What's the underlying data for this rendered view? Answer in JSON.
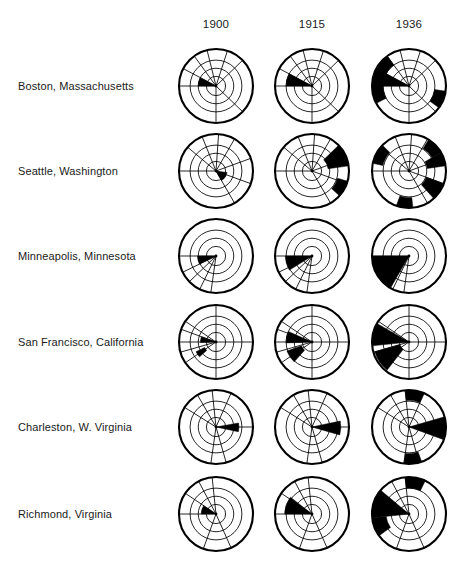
{
  "figure": {
    "title": "",
    "background": "#ffffff",
    "ink": "#000000",
    "fill": "#000000"
  },
  "columns": [
    {
      "label": "1900",
      "cx": 216
    },
    {
      "label": "1915",
      "cx": 312
    },
    {
      "label": "1936",
      "cx": 409
    }
  ],
  "rows": [
    {
      "label": "Boston, Massachusetts",
      "cy": 86
    },
    {
      "label": "Seattle, Washington",
      "cy": 171
    },
    {
      "label": "Minneapolis, Minnesota",
      "cy": 256
    },
    {
      "label": "San Francisco, California",
      "cy": 342
    },
    {
      "label": "Charleston, W. Virginia",
      "cy": 427
    },
    {
      "label": "Richmond, Virginia",
      "cy": 514
    }
  ],
  "geometry": {
    "radius": 37,
    "rings": [
      0.26,
      0.48,
      0.7,
      1.0
    ],
    "header_y": 26,
    "label_x": 18
  },
  "chart_data": {
    "type": "polar",
    "title": "",
    "subtitle": "",
    "xlabel": "",
    "ylabel": "",
    "legend": [],
    "radial_rings": 4,
    "angle_units": "degrees, 0 = east (right), measured counter-clockwise",
    "panels": [
      {
        "city": "Boston, Massachusetts",
        "year": "1900",
        "spokes": [
          180,
          152,
          126,
          104,
          72,
          44,
          270,
          316
        ],
        "sectors": [
          {
            "start": 152,
            "end": 180,
            "r_inner": 0.0,
            "r_outer": 0.48
          }
        ]
      },
      {
        "city": "Boston, Massachusetts",
        "year": "1915",
        "spokes": [
          180,
          152,
          126,
          104,
          72,
          44,
          270,
          316
        ],
        "sectors": [
          {
            "start": 152,
            "end": 180,
            "r_inner": 0.0,
            "r_outer": 0.7
          }
        ]
      },
      {
        "city": "Boston, Massachusetts",
        "year": "1936",
        "spokes": [
          180,
          152,
          126,
          104,
          72,
          44,
          270,
          316
        ],
        "sectors": [
          {
            "start": 152,
            "end": 180,
            "r_inner": 0.0,
            "r_outer": 0.7
          },
          {
            "start": 126,
            "end": 208,
            "r_inner": 0.7,
            "r_outer": 1.0
          },
          {
            "start": 324,
            "end": 352,
            "r_inner": 0.7,
            "r_outer": 1.0
          }
        ]
      },
      {
        "city": "Seattle, Washington",
        "year": "1900",
        "spokes": [
          180,
          140,
          112,
          86,
          60,
          20,
          300,
          340
        ],
        "sectors": [
          {
            "start": 300,
            "end": 352,
            "r_inner": 0.0,
            "r_outer": 0.3
          }
        ]
      },
      {
        "city": "Seattle, Washington",
        "year": "1915",
        "spokes": [
          180,
          140,
          112,
          86,
          60,
          20,
          300,
          340
        ],
        "sectors": [
          {
            "start": 8,
            "end": 44,
            "r_inner": 0.44,
            "r_outer": 1.0
          },
          {
            "start": 318,
            "end": 344,
            "r_inner": 0.72,
            "r_outer": 1.0
          }
        ]
      },
      {
        "city": "Seattle, Washington",
        "year": "1936",
        "spokes": [
          180,
          140,
          112,
          86,
          60,
          20,
          300,
          340
        ],
        "sectors": [
          {
            "start": 8,
            "end": 30,
            "r_inner": 0.5,
            "r_outer": 1.0
          },
          {
            "start": 136,
            "end": 168,
            "r_inner": 0.72,
            "r_outer": 1.0
          },
          {
            "start": 30,
            "end": 58,
            "r_inner": 0.72,
            "r_outer": 1.0
          },
          {
            "start": 312,
            "end": 340,
            "r_inner": 0.5,
            "r_outer": 1.0
          },
          {
            "start": 250,
            "end": 276,
            "r_inner": 0.72,
            "r_outer": 1.0
          }
        ]
      },
      {
        "city": "Minneapolis, Minnesota",
        "year": "1900",
        "spokes": [
          180,
          206,
          224,
          244,
          262
        ],
        "sectors": [
          {
            "start": 180,
            "end": 206,
            "r_inner": 0.0,
            "r_outer": 0.5
          }
        ]
      },
      {
        "city": "Minneapolis, Minnesota",
        "year": "1915",
        "spokes": [
          180,
          206,
          224,
          244,
          262
        ],
        "sectors": [
          {
            "start": 180,
            "end": 212,
            "r_inner": 0.0,
            "r_outer": 0.72
          }
        ]
      },
      {
        "city": "Minneapolis, Minnesota",
        "year": "1936",
        "spokes": [
          180,
          206,
          224,
          244,
          262
        ],
        "sectors": [
          {
            "start": 180,
            "end": 240,
            "r_inner": 0.0,
            "r_outer": 1.0
          }
        ]
      },
      {
        "city": "San Francisco, California",
        "year": "1900",
        "spokes": [
          90,
          180,
          270,
          0,
          146,
          160,
          196,
          214
        ],
        "sectors": [
          {
            "start": 160,
            "end": 182,
            "r_inner": 0.0,
            "r_outer": 0.42
          },
          {
            "start": 206,
            "end": 222,
            "r_inner": 0.34,
            "r_outer": 0.6
          }
        ]
      },
      {
        "city": "San Francisco, California",
        "year": "1915",
        "spokes": [
          90,
          180,
          270,
          0,
          146,
          160,
          196,
          214
        ],
        "sectors": [
          {
            "start": 156,
            "end": 182,
            "r_inner": 0.0,
            "r_outer": 0.7
          },
          {
            "start": 200,
            "end": 228,
            "r_inner": 0.3,
            "r_outer": 0.72
          }
        ]
      },
      {
        "city": "San Francisco, California",
        "year": "1936",
        "spokes": [
          90,
          180,
          270,
          0,
          146,
          160,
          196,
          214
        ],
        "sectors": [
          {
            "start": 150,
            "end": 186,
            "r_inner": 0.0,
            "r_outer": 1.0
          },
          {
            "start": 196,
            "end": 232,
            "r_inner": 0.26,
            "r_outer": 0.96
          }
        ]
      },
      {
        "city": "Charleston, W. Virginia",
        "year": "1900",
        "spokes": [
          148,
          120,
          96,
          66,
          0,
          262,
          286
        ],
        "sectors": [
          {
            "start": 348,
            "end": 10,
            "r_inner": 0.0,
            "r_outer": 0.62
          }
        ]
      },
      {
        "city": "Charleston, W. Virginia",
        "year": "1915",
        "spokes": [
          148,
          120,
          96,
          66,
          0,
          262,
          286
        ],
        "sectors": [
          {
            "start": 344,
            "end": 12,
            "r_inner": 0.0,
            "r_outer": 0.78
          }
        ]
      },
      {
        "city": "Charleston, W. Virginia",
        "year": "1936",
        "spokes": [
          148,
          120,
          96,
          66,
          0,
          262,
          286
        ],
        "sectors": [
          {
            "start": 340,
            "end": 16,
            "r_inner": 0.0,
            "r_outer": 1.0
          },
          {
            "start": 66,
            "end": 96,
            "r_inner": 0.72,
            "r_outer": 1.0
          },
          {
            "start": 262,
            "end": 290,
            "r_inner": 0.72,
            "r_outer": 1.0
          }
        ]
      },
      {
        "city": "Richmond, Virginia",
        "year": "1900",
        "spokes": [
          180,
          146,
          118,
          96,
          250,
          294
        ],
        "sectors": [
          {
            "start": 146,
            "end": 180,
            "r_inner": 0.0,
            "r_outer": 0.4
          }
        ]
      },
      {
        "city": "Richmond, Virginia",
        "year": "1915",
        "spokes": [
          180,
          146,
          118,
          96,
          250,
          294
        ],
        "sectors": [
          {
            "start": 142,
            "end": 180,
            "r_inner": 0.0,
            "r_outer": 0.74
          }
        ]
      },
      {
        "city": "Richmond, Virginia",
        "year": "1936",
        "spokes": [
          180,
          146,
          118,
          96,
          250,
          294
        ],
        "sectors": [
          {
            "start": 140,
            "end": 186,
            "r_inner": 0.0,
            "r_outer": 1.0
          },
          {
            "start": 64,
            "end": 96,
            "r_inner": 0.7,
            "r_outer": 1.0
          },
          {
            "start": 186,
            "end": 216,
            "r_inner": 0.62,
            "r_outer": 1.0
          }
        ]
      }
    ]
  }
}
